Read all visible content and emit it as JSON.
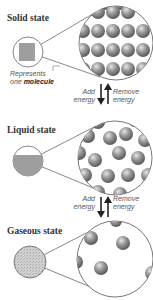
{
  "states": [
    {
      "title": "Solid state",
      "arrangement": "regular grid, close-packed"
    },
    {
      "title": "Liquid state",
      "arrangement": "close but disordered"
    },
    {
      "title": "Gaseous state",
      "arrangement": "far apart"
    }
  ],
  "molecule_note": {
    "line1": "Represents",
    "line2_prefix": "one ",
    "line2_bold": "molecule"
  },
  "transitions": [
    {
      "add_1": "Add",
      "add_2": "energy",
      "remove_1": "Remove",
      "remove_2": "energy"
    },
    {
      "add_1": "Add",
      "add_2": "energy",
      "remove_1": "Remove",
      "remove_2": "energy"
    }
  ],
  "colors": {
    "molecule": "#8a8a8a",
    "outline": "#555555",
    "fill_small": "#9e9e9e"
  }
}
